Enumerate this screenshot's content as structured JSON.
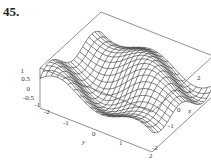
{
  "exercise_number": "45.",
  "chart_data": {
    "type": "surface3d",
    "title": "",
    "style": "wireframe mesh, boxed",
    "axes": {
      "x": {
        "label": "x",
        "ticks": [
          "-2",
          "-1",
          "0",
          "1",
          "2"
        ],
        "range": [
          -2,
          2
        ]
      },
      "y": {
        "label": "y",
        "ticks": [
          "-2",
          "-1",
          "0",
          "1",
          "2"
        ],
        "range": [
          -2,
          2
        ]
      },
      "z": {
        "label": "",
        "ticks": [
          "1",
          "0.5",
          "0",
          "-0.5",
          "-1"
        ],
        "range": [
          -1,
          1
        ]
      }
    },
    "grid": false
  },
  "labels": {
    "z_ticks": [
      "1",
      "0.5",
      "0",
      "-0.5",
      "-1"
    ],
    "y_ticks": [
      "-2",
      "-1",
      "0",
      "1",
      "2"
    ],
    "x_ticks": [
      "-2",
      "-1",
      "0",
      "1",
      "2"
    ],
    "y_label": "y",
    "x_label": "x"
  }
}
